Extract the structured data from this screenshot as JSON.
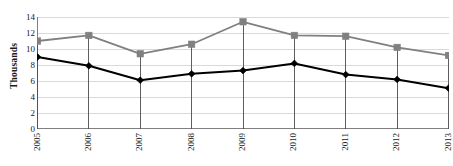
{
  "chart_data": {
    "type": "line",
    "title": "",
    "xlabel": "",
    "ylabel": "Thousands",
    "categories": [
      "2005",
      "2006",
      "2007",
      "2008",
      "2009",
      "2010",
      "2011",
      "2012",
      "2013"
    ],
    "series": [
      {
        "name": "upper-series",
        "color": "#808080",
        "marker": "square",
        "values": [
          11.0,
          11.7,
          9.4,
          10.6,
          13.4,
          11.7,
          11.6,
          10.2,
          9.2
        ]
      },
      {
        "name": "lower-series",
        "color": "#000000",
        "marker": "diamond",
        "values": [
          9.0,
          7.9,
          6.1,
          6.9,
          7.3,
          8.2,
          6.8,
          6.2,
          5.1
        ]
      }
    ],
    "ylim": [
      0,
      14
    ],
    "ytick_labels": [
      "0",
      "2",
      "4",
      "6",
      "8",
      "10",
      "12",
      "14"
    ],
    "ytick_values": [
      0,
      2,
      4,
      6,
      8,
      10,
      12,
      14
    ],
    "grid": true,
    "grid_color": "#d9d9d9",
    "legend": "none",
    "droplines": true
  }
}
